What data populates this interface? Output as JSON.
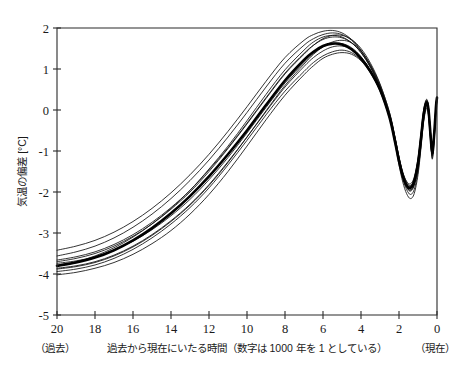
{
  "chart_data": {
    "type": "line",
    "title": "",
    "xlabel": "過去から現在にいたる時間（数字は 1000 年を 1 としている）",
    "ylabel": "気温の偏差 [°C]",
    "xlim": [
      20,
      0
    ],
    "ylim": [
      -5,
      2
    ],
    "x_ticks": [
      "20",
      "18",
      "16",
      "14",
      "12",
      "10",
      "8",
      "6",
      "4",
      "2",
      "0"
    ],
    "x_tick_values": [
      20,
      18,
      16,
      14,
      12,
      10,
      8,
      6,
      4,
      2,
      0
    ],
    "y_ticks": [
      "2",
      "1",
      "0",
      "-1",
      "-2",
      "-3",
      "-4",
      "-5"
    ],
    "y_tick_values": [
      2,
      1,
      0,
      -1,
      -2,
      -3,
      -4,
      -5
    ],
    "x_axis_left_note": "（過去）",
    "x_axis_right_note": "（現在）",
    "grid": false,
    "legend": null,
    "x_direction": "reversed",
    "x": [
      20,
      19,
      18,
      17,
      16,
      15,
      14,
      13,
      12,
      11,
      10,
      9,
      8,
      7,
      6.5,
      6,
      5.5,
      5,
      4.5,
      4,
      3.5,
      3,
      2.5,
      2.2,
      2.0,
      1.8,
      1.6,
      1.4,
      1.2,
      1.0,
      0.85,
      0.7,
      0.55,
      0.45,
      0.35,
      0.25,
      0.15,
      0.05,
      0
    ],
    "series": [
      {
        "name": "ensemble-mean",
        "style": "bold",
        "values": [
          -3.8,
          -3.72,
          -3.6,
          -3.42,
          -3.18,
          -2.88,
          -2.52,
          -2.1,
          -1.62,
          -1.08,
          -0.5,
          0.12,
          0.72,
          1.22,
          1.42,
          1.56,
          1.62,
          1.6,
          1.48,
          1.26,
          0.94,
          0.5,
          -0.18,
          -0.8,
          -1.25,
          -1.62,
          -1.84,
          -1.9,
          -1.74,
          -1.3,
          -0.72,
          -0.1,
          0.18,
          0.02,
          -0.55,
          -1.05,
          -0.6,
          0.1,
          0.3
        ]
      },
      {
        "name": "ensemble-1",
        "style": "thin",
        "values": [
          -3.42,
          -3.32,
          -3.18,
          -2.98,
          -2.72,
          -2.4,
          -2.02,
          -1.58,
          -1.08,
          -0.52,
          0.08,
          0.7,
          1.28,
          1.7,
          1.84,
          1.92,
          1.94,
          1.88,
          1.72,
          1.46,
          1.08,
          0.58,
          -0.1,
          -0.7,
          -1.15,
          -1.52,
          -1.74,
          -1.8,
          -1.64,
          -1.18,
          -0.6,
          0.02,
          0.26,
          0.08,
          -0.48,
          -0.98,
          -0.54,
          0.14,
          0.32
        ]
      },
      {
        "name": "ensemble-2",
        "style": "thin",
        "values": [
          -3.56,
          -3.46,
          -3.32,
          -3.12,
          -2.86,
          -2.54,
          -2.16,
          -1.72,
          -1.22,
          -0.66,
          -0.06,
          0.56,
          1.14,
          1.58,
          1.74,
          1.84,
          1.88,
          1.84,
          1.7,
          1.44,
          1.06,
          0.56,
          -0.12,
          -0.74,
          -1.2,
          -1.58,
          -1.8,
          -1.86,
          -1.7,
          -1.24,
          -0.66,
          -0.04,
          0.22,
          0.04,
          -0.52,
          -1.02,
          -0.58,
          0.1,
          0.3
        ]
      },
      {
        "name": "ensemble-3",
        "style": "thin",
        "values": [
          -3.66,
          -3.58,
          -3.46,
          -3.28,
          -3.04,
          -2.74,
          -2.38,
          -1.96,
          -1.46,
          -0.92,
          -0.32,
          0.3,
          0.9,
          1.38,
          1.58,
          1.72,
          1.78,
          1.76,
          1.64,
          1.4,
          1.04,
          0.56,
          -0.12,
          -0.74,
          -1.2,
          -1.58,
          -1.82,
          -1.9,
          -1.74,
          -1.28,
          -0.7,
          -0.08,
          0.2,
          0.02,
          -0.54,
          -1.04,
          -0.6,
          0.08,
          0.28
        ]
      },
      {
        "name": "ensemble-4",
        "style": "thin",
        "values": [
          -3.74,
          -3.68,
          -3.58,
          -3.42,
          -3.2,
          -2.92,
          -2.58,
          -2.18,
          -1.7,
          -1.16,
          -0.56,
          0.06,
          0.66,
          1.16,
          1.38,
          1.54,
          1.62,
          1.62,
          1.52,
          1.3,
          0.96,
          0.5,
          -0.18,
          -0.8,
          -1.26,
          -1.64,
          -1.88,
          -1.96,
          -1.8,
          -1.34,
          -0.76,
          -0.14,
          0.14,
          -0.04,
          -0.6,
          -1.1,
          -0.64,
          0.06,
          0.26
        ]
      },
      {
        "name": "ensemble-5",
        "style": "thin",
        "values": [
          -3.86,
          -3.8,
          -3.7,
          -3.54,
          -3.32,
          -3.04,
          -2.7,
          -2.3,
          -1.82,
          -1.26,
          -0.66,
          -0.04,
          0.56,
          1.06,
          1.28,
          1.44,
          1.54,
          1.56,
          1.48,
          1.28,
          0.96,
          0.52,
          -0.14,
          -0.76,
          -1.22,
          -1.62,
          -1.88,
          -1.98,
          -1.84,
          -1.4,
          -0.82,
          -0.18,
          0.12,
          -0.06,
          -0.62,
          -1.12,
          -0.66,
          0.04,
          0.24
        ]
      },
      {
        "name": "ensemble-6",
        "style": "thin",
        "values": [
          -3.94,
          -3.88,
          -3.78,
          -3.62,
          -3.4,
          -3.12,
          -2.78,
          -2.38,
          -1.9,
          -1.34,
          -0.74,
          -0.12,
          0.46,
          0.94,
          1.16,
          1.32,
          1.42,
          1.46,
          1.4,
          1.22,
          0.92,
          0.48,
          -0.16,
          -0.78,
          -1.26,
          -1.68,
          -1.94,
          -2.06,
          -1.94,
          -1.5,
          -0.9,
          -0.24,
          0.08,
          -0.1,
          -0.66,
          -1.16,
          -0.7,
          0.02,
          0.22
        ]
      },
      {
        "name": "ensemble-7",
        "style": "thin",
        "values": [
          -4.02,
          -3.96,
          -3.86,
          -3.72,
          -3.52,
          -3.26,
          -2.94,
          -2.54,
          -2.06,
          -1.5,
          -0.88,
          -0.24,
          0.36,
          0.86,
          1.08,
          1.26,
          1.36,
          1.4,
          1.36,
          1.2,
          0.9,
          0.46,
          -0.2,
          -0.84,
          -1.34,
          -1.76,
          -2.04,
          -2.16,
          -2.04,
          -1.58,
          -0.96,
          -0.28,
          0.04,
          -0.14,
          -0.7,
          -1.2,
          -0.74,
          0.0,
          0.2
        ]
      },
      {
        "name": "ensemble-8",
        "style": "thin",
        "values": [
          -3.78,
          -3.7,
          -3.56,
          -3.36,
          -3.1,
          -2.78,
          -2.4,
          -1.96,
          -1.44,
          -0.88,
          -0.26,
          0.38,
          0.98,
          1.46,
          1.66,
          1.78,
          1.82,
          1.78,
          1.64,
          1.4,
          1.04,
          0.56,
          -0.1,
          -0.72,
          -1.18,
          -1.56,
          -1.8,
          -1.88,
          -1.72,
          -1.26,
          -0.68,
          -0.06,
          0.22,
          0.04,
          -0.52,
          -1.02,
          -0.58,
          0.1,
          0.3
        ]
      },
      {
        "name": "ensemble-9",
        "style": "thin",
        "values": [
          -3.88,
          -3.82,
          -3.72,
          -3.56,
          -3.34,
          -3.06,
          -2.72,
          -2.32,
          -1.84,
          -1.28,
          -0.66,
          -0.02,
          0.6,
          1.12,
          1.36,
          1.54,
          1.66,
          1.7,
          1.64,
          1.44,
          1.1,
          0.62,
          -0.06,
          -0.68,
          -1.16,
          -1.56,
          -1.82,
          -1.94,
          -1.82,
          -1.38,
          -0.8,
          -0.16,
          0.14,
          -0.04,
          -0.6,
          -1.1,
          -0.64,
          0.06,
          0.26
        ]
      },
      {
        "name": "ensemble-10",
        "style": "thin",
        "values": [
          -3.7,
          -3.62,
          -3.5,
          -3.32,
          -3.08,
          -2.78,
          -2.42,
          -2.0,
          -1.5,
          -0.94,
          -0.34,
          0.28,
          0.88,
          1.36,
          1.58,
          1.74,
          1.82,
          1.82,
          1.72,
          1.5,
          1.14,
          0.64,
          -0.06,
          -0.68,
          -1.14,
          -1.52,
          -1.76,
          -1.84,
          -1.68,
          -1.22,
          -0.64,
          -0.02,
          0.24,
          0.06,
          -0.5,
          -1.0,
          -0.56,
          0.12,
          0.32
        ]
      }
    ]
  }
}
